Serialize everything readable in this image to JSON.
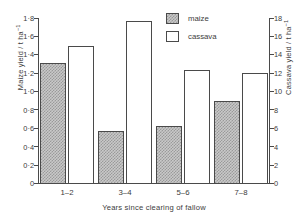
{
  "chart_data": {
    "type": "bar",
    "title": "",
    "xlabel": "Years since clearing of fallow",
    "categories": [
      "1–2",
      "3–4",
      "5–6",
      "7–8"
    ],
    "series": [
      {
        "name": "maize",
        "axis": "left",
        "unit": "t ha⁻¹",
        "values": [
          1.31,
          0.57,
          0.63,
          0.9
        ]
      },
      {
        "name": "cassava",
        "axis": "right",
        "unit": "t ha⁻¹",
        "values": [
          15.0,
          17.7,
          12.4,
          12.0
        ]
      }
    ],
    "axes": {
      "left": {
        "label_main": "Maize yield / t ha",
        "label_exponent": "−1",
        "min": 0,
        "max": 1.8,
        "step": 0.2,
        "ticks": [
          "0",
          "0·2",
          "0·4",
          "0·6",
          "0·8",
          "1·0",
          "1·2",
          "1·4",
          "1·6",
          "1·8"
        ]
      },
      "right": {
        "label_main": "Cassava yield / t ha",
        "label_exponent": "−1",
        "min": 0,
        "max": 18,
        "step": 2,
        "ticks": [
          "0",
          "2",
          "4",
          "6",
          "8",
          "10",
          "12",
          "14",
          "16",
          "18"
        ]
      }
    },
    "grid": false,
    "legend": {
      "position": "top-right",
      "entries": [
        {
          "label": "maize",
          "style": "hatched-gray"
        },
        {
          "label": "cassava",
          "style": "white-outline"
        }
      ]
    }
  }
}
